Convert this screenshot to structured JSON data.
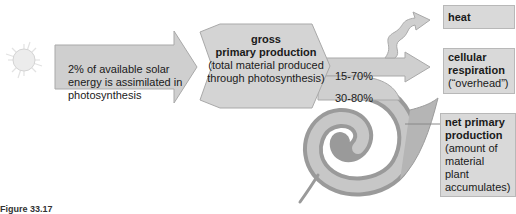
{
  "diagram": {
    "sun_icon": "sun-icon",
    "leaf_icon": "leaf-spiral-icon",
    "solar_arrow": {
      "text": "2% of available solar energy is assimilated in photosynthesis"
    },
    "gross_primary_production": {
      "title_line1": "gross",
      "title_line2": "primary production",
      "description": "(total material produced through photosynthesis)"
    },
    "percentages": {
      "heat_respiration": "15-70%",
      "net_production": "30-80%"
    },
    "outputs": {
      "heat": {
        "label": "heat"
      },
      "cellular_respiration": {
        "label": "cellular respiration",
        "note": "(“overhead”)"
      },
      "net_primary_production": {
        "label": "net primary production",
        "description": "(amount of material plant accumulates)"
      }
    },
    "caption": "Figure 33.17"
  },
  "colors": {
    "arrow_fill": "#cfcfcf",
    "arrow_stroke": "#a9a9a9",
    "box_fill": "#d9d9d9",
    "leaf_dark": "#8a8a8a",
    "leaf_light": "#c4c4c4"
  }
}
